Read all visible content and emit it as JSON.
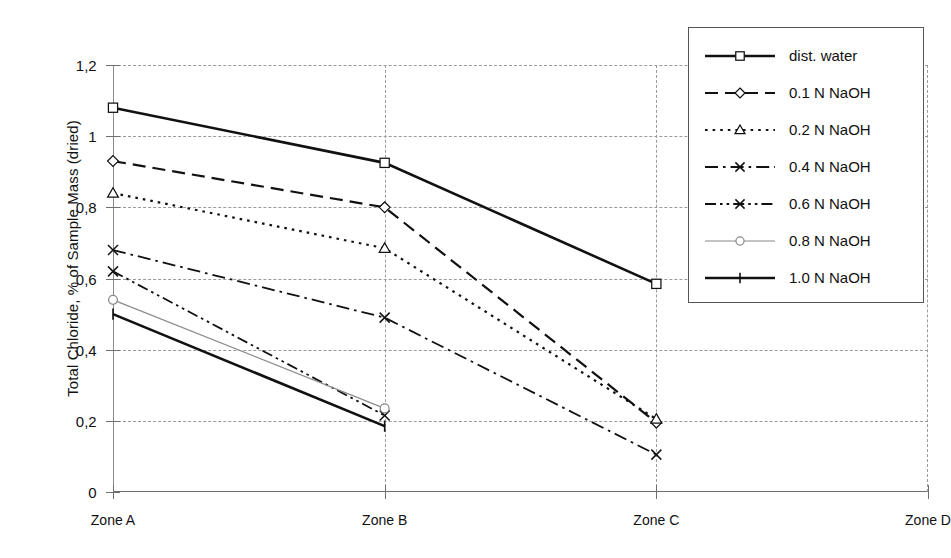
{
  "chart_data": {
    "type": "line",
    "title": "",
    "xlabel": "",
    "ylabel": "Total Chloride, % of Sample Mass (dried)",
    "categories": [
      "Zone A",
      "Zone B",
      "Zone C",
      "Zone D"
    ],
    "ylim": [
      0,
      1.2
    ],
    "yticks": [
      0,
      0.2,
      0.4,
      0.6,
      0.8,
      1,
      1.2
    ],
    "ytick_labels": [
      "0",
      "0,2",
      "0,4",
      "0,6",
      "0,8",
      "1",
      "1,2"
    ],
    "grid": true,
    "legend_position": "right",
    "series": [
      {
        "name": "dist. water",
        "values": [
          1.08,
          0.925,
          0.585,
          null
        ],
        "marker": "square",
        "dash": "solid",
        "width": 2.6,
        "color": "#111111"
      },
      {
        "name": "0.1 N NaOH",
        "values": [
          0.93,
          0.8,
          0.195,
          null
        ],
        "marker": "diamond",
        "dash": "dashed",
        "width": 2.2,
        "color": "#111111"
      },
      {
        "name": "0.2 N NaOH",
        "values": [
          0.84,
          0.685,
          0.205,
          null
        ],
        "marker": "triangle",
        "dash": "dotted",
        "width": 2.2,
        "color": "#111111"
      },
      {
        "name": "0.4 N NaOH",
        "values": [
          0.68,
          0.49,
          0.105,
          null
        ],
        "marker": "cross",
        "dash": "dashdot",
        "width": 1.8,
        "color": "#111111"
      },
      {
        "name": "0.6 N NaOH",
        "values": [
          0.62,
          0.215,
          null,
          null
        ],
        "marker": "cross",
        "dash": "dashdotdot",
        "width": 1.8,
        "color": "#111111"
      },
      {
        "name": "0.8 N NaOH",
        "values": [
          0.54,
          0.235,
          null,
          null
        ],
        "marker": "circle",
        "dash": "solid",
        "width": 1.2,
        "color": "#8a8a8a"
      },
      {
        "name": "1.0 N NaOH",
        "values": [
          0.5,
          0.185,
          null,
          null
        ],
        "marker": "tick",
        "dash": "solid",
        "width": 2.6,
        "color": "#111111"
      }
    ]
  },
  "axes": {
    "y_title": "Total Chloride, % of Sample Mass (dried)",
    "y_labels": [
      "1,2",
      "1",
      "0,8",
      "0,6",
      "0,4",
      "0,2",
      "0"
    ],
    "x_labels": [
      "Zone A",
      "Zone B",
      "Zone C",
      "Zone D"
    ]
  },
  "legend": {
    "entries": [
      {
        "label": "dist. water"
      },
      {
        "label": "0.1 N NaOH"
      },
      {
        "label": "0.2 N NaOH"
      },
      {
        "label": "0.4 N NaOH"
      },
      {
        "label": "0.6 N NaOH"
      },
      {
        "label": "0.8 N NaOH"
      },
      {
        "label": "1.0 N NaOH"
      }
    ]
  },
  "colors": {
    "ink": "#111111",
    "grid": "#9a9a9a",
    "axis": "#6f6f6f",
    "grey_series": "#8a8a8a"
  }
}
